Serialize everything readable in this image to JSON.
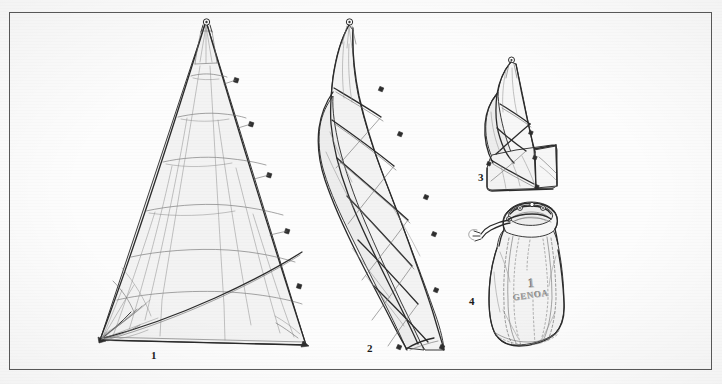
{
  "plate": {
    "title": "Sail folding and bagging sequence",
    "background_color": "#fdfdfd",
    "border_color": "#4a4a4a",
    "ink_color": "#3a3a3a",
    "fill_color": "#f2f2f2"
  },
  "figures": [
    {
      "number": "1",
      "name": "sail-spread-flat",
      "caption": "1",
      "description": "Genoa sail laid out flat, full triangle with seam panels and corner reinforcement patches"
    },
    {
      "number": "2",
      "name": "sail-flaked-long",
      "caption": "2",
      "description": "Sail flaked / rolled into a long narrow bundle along the luff"
    },
    {
      "number": "3",
      "name": "sail-folded-compact",
      "caption": "3",
      "description": "Bundle folded over itself into a compact block ready for the bag"
    },
    {
      "number": "4",
      "name": "sail-in-bag",
      "caption": "4",
      "description": "Sail stowed in drawstring sail bag with stencilled label"
    }
  ],
  "bag_label": {
    "number": "1",
    "sail_name": "GENOA"
  }
}
